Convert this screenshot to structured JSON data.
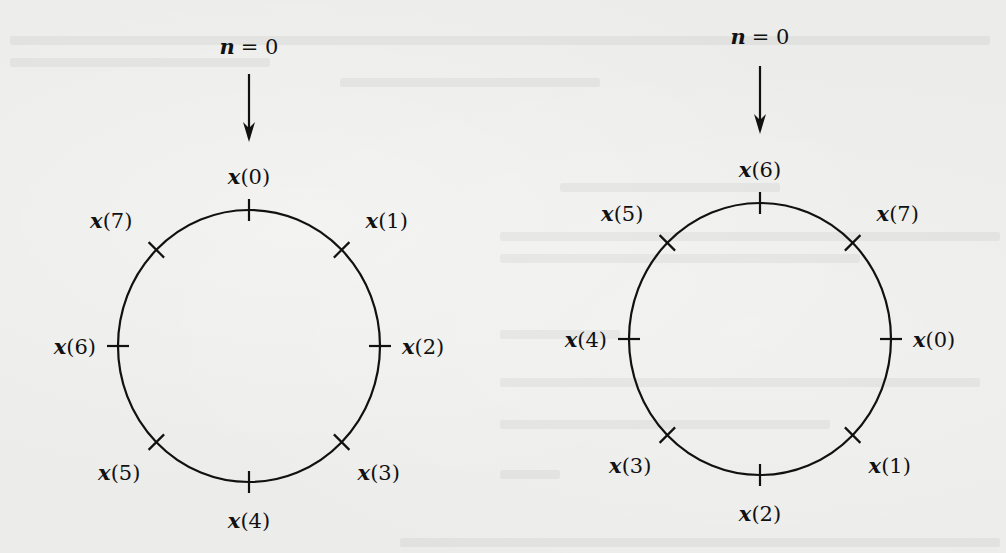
{
  "figure": {
    "stroke_color": "#111111",
    "background_color": "#ececea",
    "diagrams": [
      {
        "id": "original",
        "start_label": "n = 0",
        "start_var": "n",
        "start_eq": "= 0",
        "center": [
          249,
          346
        ],
        "radius": [
          131,
          136
        ],
        "points": [
          {
            "label": "x(0)",
            "idx": "0",
            "angle_deg": 90
          },
          {
            "label": "x(1)",
            "idx": "1",
            "angle_deg": 45
          },
          {
            "label": "x(2)",
            "idx": "2",
            "angle_deg": 0
          },
          {
            "label": "x(3)",
            "idx": "3",
            "angle_deg": -45
          },
          {
            "label": "x(4)",
            "idx": "4",
            "angle_deg": -90
          },
          {
            "label": "x(5)",
            "idx": "5",
            "angle_deg": -135
          },
          {
            "label": "x(6)",
            "idx": "6",
            "angle_deg": 180
          },
          {
            "label": "x(7)",
            "idx": "7",
            "angle_deg": 135
          }
        ]
      },
      {
        "id": "shifted",
        "start_label": "n = 0",
        "start_var": "n",
        "start_eq": "= 0",
        "center": [
          760,
          339
        ],
        "radius": [
          131,
          136
        ],
        "points": [
          {
            "label": "x(6)",
            "idx": "6",
            "angle_deg": 90
          },
          {
            "label": "x(7)",
            "idx": "7",
            "angle_deg": 45
          },
          {
            "label": "x(0)",
            "idx": "0",
            "angle_deg": 0
          },
          {
            "label": "x(1)",
            "idx": "1",
            "angle_deg": -45
          },
          {
            "label": "x(2)",
            "idx": "2",
            "angle_deg": -90
          },
          {
            "label": "x(3)",
            "idx": "3",
            "angle_deg": -135
          },
          {
            "label": "x(4)",
            "idx": "4",
            "angle_deg": 180
          },
          {
            "label": "x(5)",
            "idx": "5",
            "angle_deg": 135
          }
        ]
      }
    ]
  }
}
